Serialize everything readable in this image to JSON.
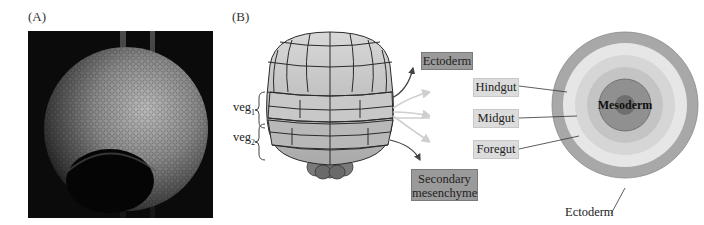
{
  "panels": {
    "a": {
      "label": "(A)",
      "image_desc": "SEM micrograph of sea urchin embryo"
    },
    "b": {
      "label": "(B)"
    }
  },
  "embryo": {
    "veg_labels": [
      {
        "base": "veg",
        "sub": "1"
      },
      {
        "base": "veg",
        "sub": "2"
      }
    ]
  },
  "fate_boxes": {
    "ectoderm": "Ectoderm",
    "hindgut": "Hindgut",
    "midgut": "Midgut",
    "foregut": "Foregut",
    "secondary_line1": "Secondary",
    "secondary_line2": "mesenchyme"
  },
  "target": {
    "center_label": "Mesoderm",
    "outer_label": "Ectoderm"
  },
  "colors": {
    "dark_box": "#9a9a9a",
    "light_box": "#dcdcdc",
    "ring_outer": "#a8a8a8",
    "ring_hindgut": "#e6e6e6",
    "ring_midgut": "#d6d6d6",
    "ring_foregut": "#c4c4c4",
    "mesoderm": "#909090",
    "center": "#6f6f6f"
  }
}
